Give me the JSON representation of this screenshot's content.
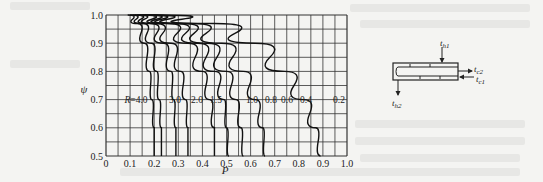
{
  "chart_data": {
    "type": "line",
    "title": "",
    "xlabel": "P",
    "ylabel": "ψ",
    "xlim": [
      0,
      1.0
    ],
    "ylim": [
      0.5,
      1.0
    ],
    "grid": true,
    "legend_position": "inline curve labels",
    "x_ticks": [
      "0",
      "0.1",
      "0.2",
      "0.3",
      "0.4",
      "0.5",
      "0.6",
      "0.7",
      "0.8",
      "0.9",
      "1.0"
    ],
    "y_ticks": [
      "0.5",
      "0.6",
      "0.7",
      "0.8",
      "0.9",
      "1.0"
    ],
    "curve_label_row": {
      "y": 0.7,
      "labels": [
        "R=4.0",
        "3.0",
        "2.0",
        "1.5",
        "1.0",
        "0.8",
        "0.6",
        "0.4",
        "0.2"
      ]
    },
    "series": [
      {
        "name": "R=4.0",
        "points": [
          [
            0.09,
            1.0
          ],
          [
            0.13,
            0.97
          ],
          [
            0.16,
            0.9
          ],
          [
            0.18,
            0.8
          ],
          [
            0.19,
            0.7
          ],
          [
            0.2,
            0.6
          ],
          [
            0.2,
            0.5
          ]
        ]
      },
      {
        "name": "R=3.0",
        "points": [
          [
            0.1,
            1.0
          ],
          [
            0.15,
            0.97
          ],
          [
            0.19,
            0.9
          ],
          [
            0.21,
            0.8
          ],
          [
            0.22,
            0.7
          ],
          [
            0.23,
            0.6
          ],
          [
            0.23,
            0.5
          ]
        ]
      },
      {
        "name": "R=2.0",
        "points": [
          [
            0.11,
            1.0
          ],
          [
            0.18,
            0.97
          ],
          [
            0.24,
            0.9
          ],
          [
            0.27,
            0.8
          ],
          [
            0.28,
            0.7
          ],
          [
            0.29,
            0.6
          ],
          [
            0.29,
            0.5
          ]
        ]
      },
      {
        "name": "R=1.5",
        "points": [
          [
            0.12,
            1.0
          ],
          [
            0.2,
            0.97
          ],
          [
            0.27,
            0.9
          ],
          [
            0.31,
            0.8
          ],
          [
            0.33,
            0.7
          ],
          [
            0.34,
            0.6
          ],
          [
            0.34,
            0.5
          ]
        ]
      },
      {
        "name": "R=1.0",
        "points": [
          [
            0.13,
            1.0
          ],
          [
            0.25,
            0.97
          ],
          [
            0.34,
            0.9
          ],
          [
            0.4,
            0.8
          ],
          [
            0.43,
            0.7
          ],
          [
            0.45,
            0.6
          ],
          [
            0.45,
            0.5
          ]
        ]
      },
      {
        "name": "R=0.8",
        "points": [
          [
            0.14,
            1.0
          ],
          [
            0.28,
            0.97
          ],
          [
            0.38,
            0.9
          ],
          [
            0.45,
            0.8
          ],
          [
            0.49,
            0.7
          ],
          [
            0.5,
            0.6
          ],
          [
            0.51,
            0.5
          ]
        ]
      },
      {
        "name": "R=0.6",
        "points": [
          [
            0.15,
            1.0
          ],
          [
            0.31,
            0.97
          ],
          [
            0.42,
            0.9
          ],
          [
            0.5,
            0.8
          ],
          [
            0.54,
            0.7
          ],
          [
            0.56,
            0.6
          ],
          [
            0.57,
            0.5
          ]
        ]
      },
      {
        "name": "R=0.4",
        "points": [
          [
            0.16,
            1.0
          ],
          [
            0.35,
            0.97
          ],
          [
            0.48,
            0.9
          ],
          [
            0.57,
            0.8
          ],
          [
            0.62,
            0.7
          ],
          [
            0.65,
            0.6
          ],
          [
            0.66,
            0.5
          ]
        ]
      },
      {
        "name": "R=0.2",
        "points": [
          [
            0.18,
            1.0
          ],
          [
            0.45,
            0.97
          ],
          [
            0.62,
            0.9
          ],
          [
            0.74,
            0.8
          ],
          [
            0.82,
            0.7
          ],
          [
            0.87,
            0.6
          ],
          [
            0.89,
            0.5
          ]
        ]
      }
    ]
  },
  "inset": {
    "labels": {
      "th1": "t",
      "th1_sub": "h1",
      "th2": "t",
      "th2_sub": "h2",
      "tc1": "t",
      "tc1_sub": "c1",
      "tc2": "t",
      "tc2_sub": "c2"
    }
  }
}
